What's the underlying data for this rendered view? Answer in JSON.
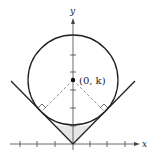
{
  "diagram": {
    "type": "circle tangent to V-shaped lines",
    "axes": {
      "x_label": "x",
      "y_label": "y",
      "x_ticks_left": 3,
      "x_ticks_right": 3,
      "y_ticks": 5
    },
    "center_label": "(0, k)",
    "elements": [
      "circle centered on y-axis",
      "two lines y = |x| forming a V through origin",
      "dashed radii from center to tangent points",
      "right-angle markers at tangent points",
      "shaded region between circle and V below circle"
    ],
    "colors": {
      "stroke": "#222222",
      "dashed": "#888888",
      "shade": "#e6e6e6"
    }
  }
}
